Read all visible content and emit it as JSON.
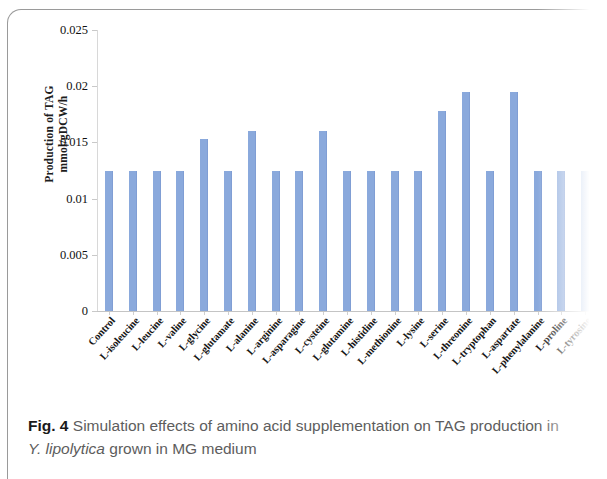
{
  "figure": {
    "caption_label": "Fig. 4",
    "caption_text_part1": "Simulation effects of amino acid supplementation on TAG production in",
    "caption_species": "Y. lipolytica",
    "caption_text_part2": "grown in MG medium"
  },
  "colors": {
    "bar": "#8aa9dc",
    "axis": "#c9c9c9",
    "frame": "#9a9a9a",
    "caption_text": "#5d5d5d"
  },
  "chart_data": {
    "type": "bar",
    "title": "",
    "xlabel": "",
    "ylabel": "Production of TAG mmol/gDCW/h",
    "ylabel_line1": "Production of TAG",
    "ylabel_line2": "mmol/gDCW/h",
    "ylim": [
      0,
      0.025
    ],
    "ytick_values": [
      0.025,
      0.02,
      0.015,
      0.01,
      0.005,
      0
    ],
    "ytick_labels": [
      "0.025",
      "0.02",
      "0.015",
      "0.01",
      "0.005",
      "0"
    ],
    "grid": false,
    "legend": "none",
    "units": "mmol/gDCW/h",
    "categories": [
      "Control",
      "L-isoleucine",
      "L-leucine",
      "L-valine",
      "L-glycine",
      "L-glutamate",
      "L-alanine",
      "L-arginine",
      "L-asparagine",
      "L-cysteine",
      "L-glutamine",
      "L-histidine",
      "L-methionine",
      "L-lysine",
      "L-serine",
      "L-threonine",
      "L-tryptophan",
      "L-aspartate",
      "L-phenylalanine",
      "L-proline",
      "L-tyrosine"
    ],
    "values": [
      0.0125,
      0.0125,
      0.0125,
      0.0125,
      0.0153,
      0.0125,
      0.016,
      0.0125,
      0.0125,
      0.016,
      0.0125,
      0.0125,
      0.0125,
      0.0125,
      0.0178,
      0.0195,
      0.0125,
      0.0195,
      0.0125,
      0.0125,
      0.0125
    ]
  }
}
